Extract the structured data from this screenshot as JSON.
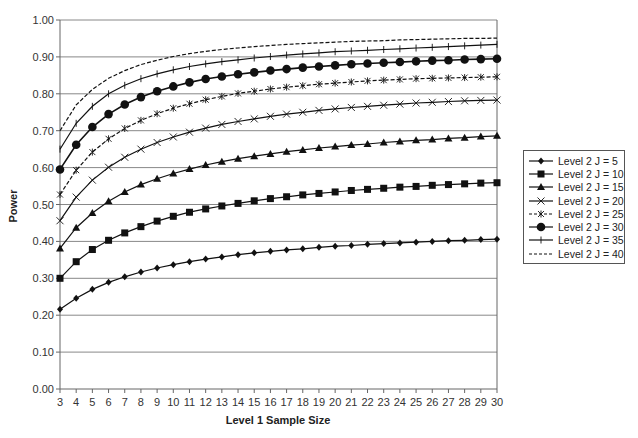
{
  "chart_data": {
    "type": "line",
    "title": "",
    "xlabel": "Level 1 Sample Size",
    "ylabel": "Power",
    "ylim": [
      0,
      1.0
    ],
    "xlim": [
      3,
      30
    ],
    "grid": true,
    "legend_position": "right",
    "y_ticks": [
      "0.00",
      "0.10",
      "0.20",
      "0.30",
      "0.40",
      "0.50",
      "0.60",
      "0.70",
      "0.80",
      "0.90",
      "1.00"
    ],
    "x": [
      3,
      4,
      5,
      6,
      7,
      8,
      9,
      10,
      11,
      12,
      13,
      14,
      15,
      16,
      17,
      18,
      19,
      20,
      21,
      22,
      23,
      24,
      25,
      26,
      27,
      28,
      29,
      30
    ],
    "series": [
      {
        "name": "Level 2 J = 5",
        "marker": "diamond",
        "dash": "solid",
        "values": [
          0.216,
          0.246,
          0.27,
          0.289,
          0.304,
          0.317,
          0.328,
          0.337,
          0.345,
          0.352,
          0.358,
          0.364,
          0.369,
          0.373,
          0.377,
          0.38,
          0.384,
          0.387,
          0.389,
          0.392,
          0.394,
          0.396,
          0.398,
          0.4,
          0.402,
          0.403,
          0.405,
          0.406
        ]
      },
      {
        "name": "Level 2 J = 10",
        "marker": "square",
        "dash": "solid",
        "values": [
          0.3,
          0.345,
          0.378,
          0.403,
          0.423,
          0.44,
          0.455,
          0.468,
          0.479,
          0.488,
          0.496,
          0.503,
          0.51,
          0.516,
          0.521,
          0.526,
          0.53,
          0.534,
          0.538,
          0.541,
          0.544,
          0.547,
          0.549,
          0.552,
          0.554,
          0.556,
          0.558,
          0.559
        ]
      },
      {
        "name": "Level 2 J = 15",
        "marker": "triangle",
        "dash": "solid",
        "values": [
          0.381,
          0.437,
          0.477,
          0.509,
          0.534,
          0.554,
          0.57,
          0.584,
          0.596,
          0.607,
          0.616,
          0.624,
          0.631,
          0.637,
          0.643,
          0.648,
          0.653,
          0.657,
          0.661,
          0.664,
          0.668,
          0.671,
          0.674,
          0.676,
          0.679,
          0.681,
          0.684,
          0.686
        ]
      },
      {
        "name": "Level 2 J = 20",
        "marker": "x",
        "dash": "solid",
        "values": [
          0.456,
          0.52,
          0.566,
          0.601,
          0.628,
          0.65,
          0.668,
          0.683,
          0.696,
          0.707,
          0.717,
          0.725,
          0.732,
          0.739,
          0.745,
          0.75,
          0.755,
          0.759,
          0.763,
          0.766,
          0.769,
          0.772,
          0.775,
          0.777,
          0.779,
          0.781,
          0.782,
          0.783
        ]
      },
      {
        "name": "Level 2 J = 25",
        "marker": "asterisk",
        "dash": "dashed",
        "values": [
          0.527,
          0.593,
          0.642,
          0.678,
          0.706,
          0.728,
          0.746,
          0.761,
          0.773,
          0.784,
          0.793,
          0.801,
          0.807,
          0.813,
          0.818,
          0.822,
          0.826,
          0.829,
          0.832,
          0.835,
          0.837,
          0.839,
          0.841,
          0.842,
          0.843,
          0.844,
          0.845,
          0.846
        ]
      },
      {
        "name": "Level 2 J = 30",
        "marker": "circle",
        "dash": "solid",
        "values": [
          0.595,
          0.662,
          0.71,
          0.745,
          0.771,
          0.791,
          0.807,
          0.82,
          0.831,
          0.84,
          0.847,
          0.853,
          0.858,
          0.863,
          0.867,
          0.871,
          0.874,
          0.877,
          0.88,
          0.882,
          0.884,
          0.886,
          0.888,
          0.89,
          0.891,
          0.893,
          0.894,
          0.895
        ]
      },
      {
        "name": "Level 2 J = 35",
        "marker": "plus",
        "dash": "solid",
        "values": [
          0.65,
          0.72,
          0.766,
          0.8,
          0.823,
          0.841,
          0.854,
          0.865,
          0.874,
          0.881,
          0.887,
          0.892,
          0.897,
          0.901,
          0.905,
          0.908,
          0.911,
          0.914,
          0.916,
          0.918,
          0.92,
          0.922,
          0.924,
          0.926,
          0.928,
          0.93,
          0.932,
          0.934
        ]
      },
      {
        "name": "Level 2 J = 40",
        "marker": "none",
        "dash": "dashed",
        "values": [
          0.7,
          0.77,
          0.812,
          0.842,
          0.863,
          0.879,
          0.891,
          0.901,
          0.909,
          0.915,
          0.92,
          0.924,
          0.928,
          0.931,
          0.934,
          0.936,
          0.938,
          0.94,
          0.942,
          0.943,
          0.944,
          0.946,
          0.947,
          0.948,
          0.949,
          0.95,
          0.95,
          0.951
        ]
      }
    ]
  },
  "axes": {
    "xlabel": "Level 1 Sample Size",
    "ylabel": "Power"
  },
  "legend": {
    "items": [
      "Level 2 J = 5",
      "Level 2 J = 10",
      "Level 2 J = 15",
      "Level 2 J = 20",
      "Level 2 J = 25",
      "Level 2 J = 30",
      "Level 2 J = 35",
      "Level 2 J = 40"
    ]
  },
  "colors": {
    "line": "#111111",
    "grid": "#888888",
    "axis": "#666666"
  }
}
